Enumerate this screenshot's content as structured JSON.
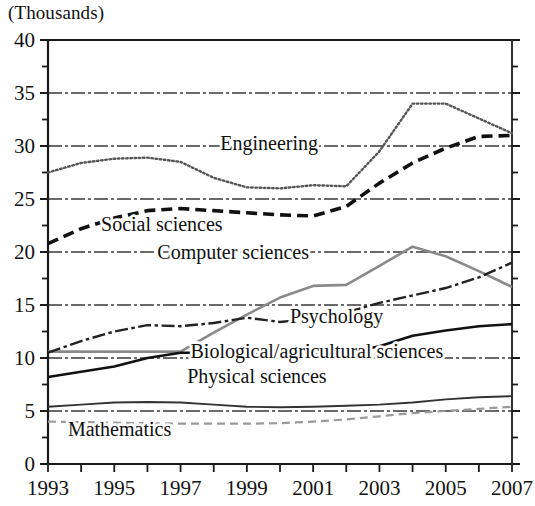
{
  "axis_note": "(Thousands)",
  "chart_data": {
    "type": "line",
    "title": "",
    "subtitle": "",
    "xlabel": "",
    "ylabel": "(Thousands)",
    "unit_note": "(Thousands)",
    "xlim": [
      1993,
      2007
    ],
    "ylim": [
      0,
      40
    ],
    "grid": true,
    "grid_style": "dash-dot horizontal gridlines at every 5 units",
    "legend_position": "inline labels on plot",
    "x": [
      1993,
      1994,
      1995,
      1996,
      1997,
      1998,
      1999,
      2000,
      2001,
      2002,
      2003,
      2004,
      2005,
      2006,
      2007
    ],
    "xticks": [
      1993,
      1994,
      1995,
      1996,
      1997,
      1998,
      1999,
      2000,
      2001,
      2002,
      2003,
      2004,
      2005,
      2006,
      2007
    ],
    "xtick_labels": [
      "1993",
      "",
      "1995",
      "",
      "1997",
      "",
      "1999",
      "",
      "2001",
      "",
      "2003",
      "",
      "2005",
      "",
      "2007"
    ],
    "yticks": [
      0,
      5,
      10,
      15,
      20,
      25,
      30,
      35,
      40
    ],
    "ytick_labels": [
      "0",
      "5",
      "10",
      "15",
      "20",
      "25",
      "30",
      "35",
      "40"
    ],
    "yminor": [
      2.5,
      7.5,
      12.5,
      17.5,
      22.5,
      27.5,
      32.5,
      37.5
    ],
    "series": [
      {
        "name": "Engineering",
        "style": "dotted",
        "color": "#555555",
        "values": [
          27.5,
          28.4,
          28.8,
          28.9,
          28.5,
          27.0,
          26.1,
          26.0,
          26.3,
          26.2,
          29.5,
          34.0,
          34.0,
          32.6,
          31.2
        ]
      },
      {
        "name": "Social sciences",
        "style": "dashed",
        "color": "#111111",
        "values": [
          20.8,
          22.2,
          23.2,
          23.9,
          24.1,
          23.9,
          23.7,
          23.5,
          23.4,
          24.3,
          26.5,
          28.4,
          29.8,
          30.9,
          31.0
        ]
      },
      {
        "name": "Computer sciences",
        "style": "solid",
        "color": "#8a8a8a",
        "values": [
          10.6,
          10.6,
          10.6,
          10.6,
          10.6,
          12.4,
          14.1,
          15.7,
          16.8,
          16.9,
          18.7,
          20.5,
          19.6,
          18.2,
          16.7
        ]
      },
      {
        "name": "Psychology",
        "style": "dashdot",
        "color": "#222222",
        "values": [
          10.5,
          11.6,
          12.5,
          13.1,
          13.0,
          13.3,
          13.8,
          13.4,
          13.7,
          14.3,
          15.2,
          15.9,
          16.6,
          17.6,
          19.0
        ]
      },
      {
        "name": "Biological/agricultural sciences",
        "style": "solid",
        "color": "#111111",
        "values": [
          8.2,
          8.7,
          9.2,
          10.0,
          10.5,
          10.5,
          10.5,
          10.5,
          10.5,
          10.5,
          11.1,
          12.1,
          12.6,
          13.0,
          13.2
        ]
      },
      {
        "name": "Physical sciences",
        "style": "solid-thin",
        "color": "#333333",
        "values": [
          5.4,
          5.6,
          5.8,
          5.85,
          5.8,
          5.6,
          5.4,
          5.35,
          5.4,
          5.5,
          5.6,
          5.8,
          6.1,
          6.3,
          6.4
        ]
      },
      {
        "name": "Mathematics",
        "style": "dashed-light",
        "color": "#9a9a9a",
        "values": [
          4.0,
          3.95,
          3.9,
          3.85,
          3.8,
          3.8,
          3.8,
          3.85,
          4.0,
          4.2,
          4.5,
          4.8,
          5.0,
          5.2,
          5.4
        ]
      }
    ],
    "annotations": [
      {
        "text": "Engineering",
        "x": 1998.2,
        "y": 29.6
      },
      {
        "text": "Social sciences",
        "x": 1994.6,
        "y": 22.0
      },
      {
        "text": "Computer sciences",
        "x": 1996.3,
        "y": 19.3
      },
      {
        "text": "Psychology",
        "x": 2000.3,
        "y": 13.3
      },
      {
        "text": "Biological/agricultural sciences",
        "x": 1997.3,
        "y": 10.0
      },
      {
        "text": "Physical sciences",
        "x": 1997.2,
        "y": 7.6
      },
      {
        "text": "Mathematics",
        "x": 1993.6,
        "y": 2.6
      }
    ]
  }
}
